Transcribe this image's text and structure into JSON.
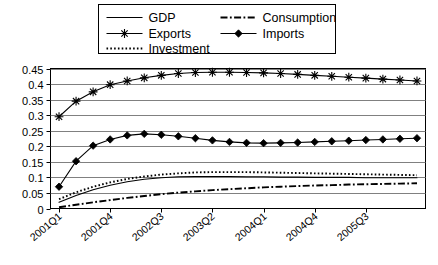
{
  "chart_data": {
    "type": "line",
    "title": "",
    "subtitle": "",
    "xlabel": "",
    "ylabel": "",
    "grid": true,
    "legend_position": "top",
    "ylim": [
      0,
      0.45
    ],
    "ytick_labels": [
      "0",
      "0.05",
      "0.1",
      "0.15",
      "0.2",
      "0.25",
      "0.3",
      "0.35",
      "0.4",
      "0.45"
    ],
    "ytick_values": [
      0,
      0.05,
      0.1,
      0.15,
      0.2,
      0.25,
      0.3,
      0.35,
      0.4,
      0.45
    ],
    "categories": [
      "2001Q1",
      "2001Q2",
      "2001Q3",
      "2001Q4",
      "2002Q1",
      "2002Q2",
      "2002Q3",
      "2002Q4",
      "2003Q1",
      "2003Q2",
      "2003Q3",
      "2003Q4",
      "2004Q1",
      "2004Q2",
      "2004Q3",
      "2004Q4",
      "2005Q1",
      "2005Q2",
      "2005Q3",
      "2005Q4",
      "2006Q1",
      "2006Q2"
    ],
    "xtick_labels_shown": [
      "2001Q1",
      "2001Q4",
      "2002Q3",
      "2003Q2",
      "2004Q1",
      "2004Q4",
      "2005Q3"
    ],
    "xtick_label_indices": [
      0,
      3,
      6,
      9,
      12,
      15,
      18
    ],
    "series": [
      {
        "name": "GDP",
        "style": "solid",
        "marker": "none",
        "color": "#000000",
        "values": [
          0.02,
          0.042,
          0.06,
          0.075,
          0.086,
          0.094,
          0.099,
          0.102,
          0.103,
          0.103,
          0.103,
          0.102,
          0.102,
          0.101,
          0.101,
          0.1,
          0.1,
          0.1,
          0.099,
          0.099,
          0.099,
          0.099
        ]
      },
      {
        "name": "Consumption",
        "style": "dash-dot",
        "marker": "none",
        "color": "#000000",
        "values": [
          0.004,
          0.012,
          0.02,
          0.027,
          0.034,
          0.04,
          0.046,
          0.051,
          0.055,
          0.059,
          0.062,
          0.065,
          0.068,
          0.07,
          0.072,
          0.074,
          0.075,
          0.077,
          0.078,
          0.079,
          0.08,
          0.081
        ]
      },
      {
        "name": "Exports",
        "style": "solid",
        "marker": "asterisk",
        "color": "#000000",
        "values": [
          0.295,
          0.345,
          0.375,
          0.398,
          0.41,
          0.42,
          0.428,
          0.434,
          0.437,
          0.438,
          0.438,
          0.437,
          0.436,
          0.434,
          0.431,
          0.428,
          0.425,
          0.422,
          0.419,
          0.416,
          0.413,
          0.41
        ]
      },
      {
        "name": "Investment",
        "style": "dotted",
        "marker": "none",
        "color": "#000000",
        "values": [
          0.03,
          0.052,
          0.07,
          0.084,
          0.095,
          0.103,
          0.109,
          0.113,
          0.116,
          0.117,
          0.117,
          0.117,
          0.116,
          0.115,
          0.114,
          0.113,
          0.112,
          0.111,
          0.11,
          0.109,
          0.108,
          0.107
        ]
      },
      {
        "name": "Imports",
        "style": "solid",
        "marker": "diamond",
        "color": "#000000",
        "values": [
          0.07,
          0.152,
          0.202,
          0.222,
          0.235,
          0.24,
          0.237,
          0.232,
          0.226,
          0.219,
          0.214,
          0.211,
          0.21,
          0.211,
          0.212,
          0.214,
          0.216,
          0.218,
          0.22,
          0.222,
          0.224,
          0.226
        ]
      }
    ]
  },
  "legend": {
    "items": [
      {
        "label": "GDP",
        "style": "solid",
        "marker": "none"
      },
      {
        "label": "Consumption",
        "style": "dash-dot",
        "marker": "none"
      },
      {
        "label": "Exports",
        "style": "solid",
        "marker": "asterisk"
      },
      {
        "label": "Imports",
        "style": "solid",
        "marker": "diamond"
      },
      {
        "label": "Investment",
        "style": "dotted",
        "marker": "none"
      }
    ]
  },
  "colors": {
    "plot_background": "#ffffff",
    "axis": "#000000",
    "gridline": "#808080",
    "series": "#000000"
  }
}
